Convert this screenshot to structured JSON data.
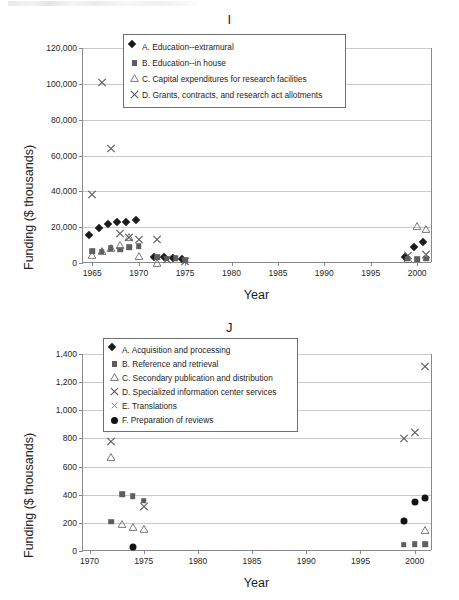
{
  "page": {
    "background": "#ffffff",
    "scan_artifact": true
  },
  "charts": [
    {
      "id": "I",
      "title": "I",
      "xlabel": "Year",
      "ylabel": "Funding ($ thousands)",
      "ylim": [
        0,
        120000
      ],
      "yticks": [
        0,
        20000,
        40000,
        60000,
        80000,
        100000,
        120000
      ],
      "ytick_labels": [
        "0",
        "20,000",
        "40,000",
        "60,000",
        "80,000",
        "100,000",
        "120,000"
      ],
      "xlim": [
        1964,
        2001.6
      ],
      "xticks": [
        1965,
        1970,
        1975,
        1980,
        1985,
        1990,
        1995,
        2000
      ],
      "xtick_labels": [
        "1965",
        "1970",
        "1975",
        "1980",
        "1985",
        "1990",
        "1995",
        "2000"
      ],
      "grid": true,
      "legend_position": "top-right-inside",
      "legend": [
        {
          "marker": "diamond",
          "label": "A. Education--extramural"
        },
        {
          "marker": "square",
          "label": "B. Education--in house"
        },
        {
          "marker": "triangle",
          "label": "C. Capital expenditures for research facilities"
        },
        {
          "marker": "cross",
          "label": "D. Grants, contracts, and research act allotments"
        }
      ],
      "series": [
        {
          "name": "A. Education--extramural",
          "marker": "diamond",
          "points": [
            [
              1965,
              14200
            ],
            [
              1966,
              18000
            ],
            [
              1967,
              20100
            ],
            [
              1968,
              21400
            ],
            [
              1969,
              21100
            ],
            [
              1970,
              22600
            ],
            [
              1972,
              1600
            ],
            [
              1973,
              1400
            ],
            [
              1974,
              1300
            ],
            [
              1975,
              800
            ],
            [
              1999,
              1400
            ],
            [
              2000,
              7300
            ],
            [
              2001,
              10000
            ]
          ]
        },
        {
          "name": "B. Education--in house",
          "marker": "square",
          "points": [
            [
              1965,
              6500
            ],
            [
              1966,
              6300
            ],
            [
              1967,
              8200
            ],
            [
              1968,
              7400
            ],
            [
              1969,
              8700
            ],
            [
              1970,
              9300
            ],
            [
              1972,
              3200
            ],
            [
              1973,
              2500
            ],
            [
              1974,
              2700
            ],
            [
              1975,
              1400
            ],
            [
              1999,
              2300
            ],
            [
              2000,
              2200
            ],
            [
              2001,
              2400
            ]
          ]
        },
        {
          "name": "C. Capital expenditures for research facilities",
          "marker": "triangle",
          "points": [
            [
              1965,
              5200
            ],
            [
              1966,
              7100
            ],
            [
              1967,
              9000
            ],
            [
              1968,
              10500
            ],
            [
              1969,
              15100
            ],
            [
              1970,
              4700
            ],
            [
              1972,
              700
            ],
            [
              1999,
              2600
            ],
            [
              2000,
              21300
            ],
            [
              2001,
              19400
            ]
          ]
        },
        {
          "name": "D. Grants, contracts, and research act allotments",
          "marker": "cross",
          "points": [
            [
              1965,
              38500
            ],
            [
              1966,
              101000
            ],
            [
              1967,
              64200
            ],
            [
              1968,
              16700
            ],
            [
              1969,
              14300
            ],
            [
              1970,
              13500
            ],
            [
              1972,
              13500
            ],
            [
              1973,
              2400
            ],
            [
              1975,
              900
            ],
            [
              1999,
              4400
            ],
            [
              2001,
              5200
            ]
          ]
        }
      ]
    },
    {
      "id": "J",
      "title": "J",
      "xlabel": "Year",
      "ylabel": "Funding ($ thousands)",
      "ylim": [
        0,
        1400
      ],
      "yticks": [
        0,
        200,
        400,
        600,
        800,
        1000,
        1200,
        1400
      ],
      "ytick_labels": [
        "0",
        "200",
        "400",
        "600",
        "800",
        "1,000",
        "1,200",
        "1,400"
      ],
      "xlim": [
        1969.4,
        2001.6
      ],
      "xticks": [
        1970,
        1975,
        1980,
        1985,
        1990,
        1995,
        2000
      ],
      "xtick_labels": [
        "1970",
        "1975",
        "1980",
        "1985",
        "1990",
        "1995",
        "2000"
      ],
      "grid": true,
      "legend_position": "top-center-inside",
      "legend": [
        {
          "marker": "diamond",
          "label": "A. Acquisition and processing"
        },
        {
          "marker": "square",
          "label": "B. Reference and retrieval"
        },
        {
          "marker": "triangle",
          "label": "C. Secondary publication and distribution"
        },
        {
          "marker": "cross",
          "label": "D. Specialized information center services"
        },
        {
          "marker": "xsmall",
          "label": "E. Translations"
        },
        {
          "marker": "circle",
          "label": "F. Preparation of reviews"
        }
      ],
      "series": [
        {
          "name": "A. Acquisition and processing",
          "marker": "diamond",
          "points": [
            [
              1972,
              855
            ]
          ]
        },
        {
          "name": "B. Reference and retrieval",
          "marker": "square",
          "points": [
            [
              1972,
              208
            ],
            [
              1973,
              402
            ],
            [
              1974,
              388
            ],
            [
              1975,
              358
            ],
            [
              1999,
              45
            ],
            [
              2000,
              48
            ],
            [
              2001,
              48
            ]
          ]
        },
        {
          "name": "C. Secondary publication and distribution",
          "marker": "triangle",
          "points": [
            [
              1972,
              675
            ],
            [
              1973,
              196
            ],
            [
              1974,
              178
            ],
            [
              1975,
              165
            ],
            [
              2001,
              158
            ]
          ]
        },
        {
          "name": "D. Specialized information center services",
          "marker": "cross",
          "points": [
            [
              1972,
              785
            ],
            [
              1973,
              1250
            ],
            [
              1974,
              1010
            ],
            [
              1975,
              320
            ],
            [
              1999,
              800
            ],
            [
              2000,
              845
            ],
            [
              2001,
              1315
            ]
          ]
        },
        {
          "name": "E. Translations",
          "marker": "xsmall",
          "points": []
        },
        {
          "name": "F. Preparation of reviews",
          "marker": "circle",
          "points": [
            [
              1974,
              28
            ],
            [
              1999,
              215
            ],
            [
              2000,
              350
            ],
            [
              2001,
              375
            ]
          ]
        }
      ]
    }
  ]
}
